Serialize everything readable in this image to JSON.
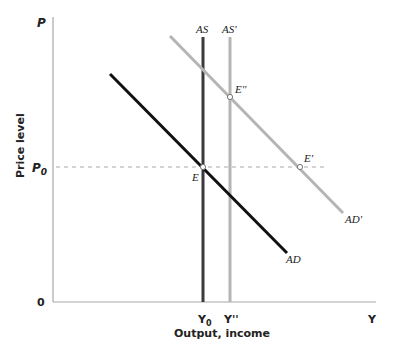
{
  "diagram": {
    "type": "AS-AD economics diagram",
    "y_axis": {
      "top_label": "P",
      "title": "Price level",
      "origin_label": "0",
      "tick_label": "P",
      "tick_sub": "0"
    },
    "x_axis": {
      "end_label": "Y",
      "title": "Output, income",
      "tick1_label": "Y",
      "tick1_sub": "0",
      "tick2_label": "Y''"
    },
    "curves": {
      "as": {
        "label": "AS",
        "color": "#3a3a3a"
      },
      "as_prime": {
        "label": "AS'",
        "color": "#b5b5b5"
      },
      "ad": {
        "label": "AD",
        "color": "#111111"
      },
      "ad_prime": {
        "label": "AD'",
        "color": "#b5b5b5"
      }
    },
    "points": {
      "e": {
        "label": "E"
      },
      "e_double_prime": {
        "label": "E''"
      },
      "e_prime": {
        "label": "E'"
      }
    },
    "reference_line": {
      "style": "dashed",
      "at": "P0",
      "color": "#9a9a9a"
    }
  }
}
